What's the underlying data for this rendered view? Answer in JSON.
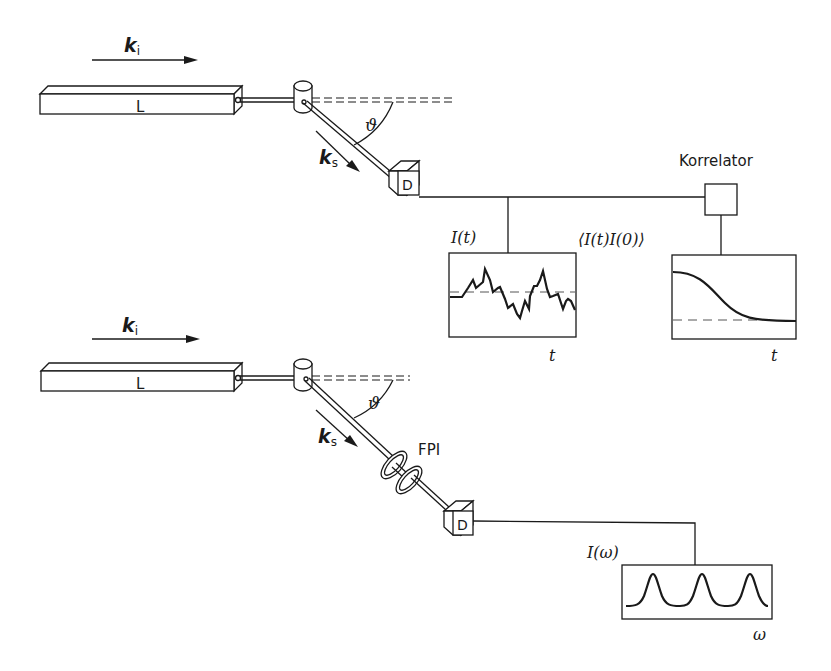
{
  "diagram": {
    "colors": {
      "ink": "#1a1a1a",
      "background": "#ffffff"
    },
    "top_setup": {
      "incident_wavevector": {
        "symbol": "k",
        "subscript": "i"
      },
      "laser_label": "L",
      "scattered_wavevector": {
        "symbol": "k",
        "subscript": "s"
      },
      "scattering_angle": "ϑ",
      "detector_label": "D",
      "correlator_label": "Korrelator",
      "signal_plot": {
        "ylabel": "I(t)",
        "xlabel": "t"
      },
      "correlation_plot": {
        "ylabel": "⟨I(t)I(0)⟩",
        "xlabel": "t"
      }
    },
    "bottom_setup": {
      "incident_wavevector": {
        "symbol": "k",
        "subscript": "i"
      },
      "laser_label": "L",
      "scattered_wavevector": {
        "symbol": "k",
        "subscript": "s"
      },
      "scattering_angle": "ϑ",
      "filter_label": "FPI",
      "detector_label": "D",
      "spectrum_plot": {
        "ylabel": "I(ω)",
        "xlabel": "ω"
      }
    }
  }
}
